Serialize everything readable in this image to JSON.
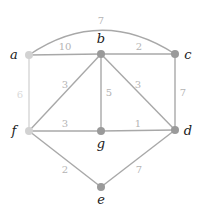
{
  "graph": {
    "nodes": [
      {
        "id": "a",
        "label": "a",
        "x": 29,
        "y": 55,
        "shade": "light"
      },
      {
        "id": "b",
        "label": "b",
        "x": 101,
        "y": 54,
        "shade": "dark"
      },
      {
        "id": "c",
        "label": "c",
        "x": 175,
        "y": 54,
        "shade": "dark"
      },
      {
        "id": "f",
        "label": "f",
        "x": 29,
        "y": 131,
        "shade": "light"
      },
      {
        "id": "g",
        "label": "g",
        "x": 101,
        "y": 131,
        "shade": "dark"
      },
      {
        "id": "d",
        "label": "d",
        "x": 175,
        "y": 130,
        "shade": "dark"
      },
      {
        "id": "e",
        "label": "e",
        "x": 101,
        "y": 187,
        "shade": "dark"
      }
    ],
    "edges": [
      {
        "from": "a",
        "to": "c",
        "weight": "7",
        "curved": true
      },
      {
        "from": "a",
        "to": "b",
        "weight": "10"
      },
      {
        "from": "b",
        "to": "c",
        "weight": "2"
      },
      {
        "from": "a",
        "to": "f",
        "weight": "6"
      },
      {
        "from": "b",
        "to": "f",
        "weight": "3"
      },
      {
        "from": "b",
        "to": "g",
        "weight": "5"
      },
      {
        "from": "b",
        "to": "d",
        "weight": "3"
      },
      {
        "from": "c",
        "to": "d",
        "weight": "7"
      },
      {
        "from": "f",
        "to": "g",
        "weight": "3"
      },
      {
        "from": "g",
        "to": "d",
        "weight": "1"
      },
      {
        "from": "f",
        "to": "e",
        "weight": "2"
      },
      {
        "from": "e",
        "to": "d",
        "weight": "7"
      }
    ],
    "colors": {
      "edge": "#a8a8a8",
      "edge_light": "#d6d6d6",
      "node_dark": "#9a9a9a",
      "node_light": "#d2d2d2",
      "weight_text": "#b4b4b4",
      "label_text": "#1a1a1a"
    }
  }
}
